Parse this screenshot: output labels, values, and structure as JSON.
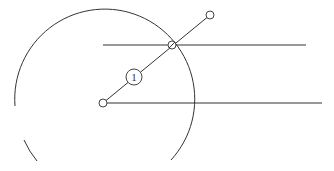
{
  "diagram": {
    "colors": {
      "stroke": "#333333",
      "background": "#ffffff"
    },
    "circle_arc": {
      "cx": 103,
      "cy": 103,
      "r": 90
    },
    "lines": [
      {
        "name": "upper-horizontal-line",
        "x1": 103,
        "y1": 45,
        "x2": 306,
        "y2": 45
      },
      {
        "name": "lower-horizontal-line",
        "x1": 106,
        "y1": 103,
        "x2": 322,
        "y2": 103
      },
      {
        "name": "diagonal-line",
        "x1": 103,
        "y1": 103,
        "x2": 210,
        "y2": 15
      }
    ],
    "nodes": [
      {
        "name": "center-node",
        "cx": 103,
        "cy": 103,
        "r": 4
      },
      {
        "name": "intersection-node",
        "cx": 172,
        "cy": 45,
        "r": 4
      },
      {
        "name": "end-node",
        "cx": 210,
        "cy": 15,
        "r": 4
      }
    ],
    "label_node": {
      "cx": 134,
      "cy": 77,
      "r": 8,
      "text": "1"
    }
  }
}
